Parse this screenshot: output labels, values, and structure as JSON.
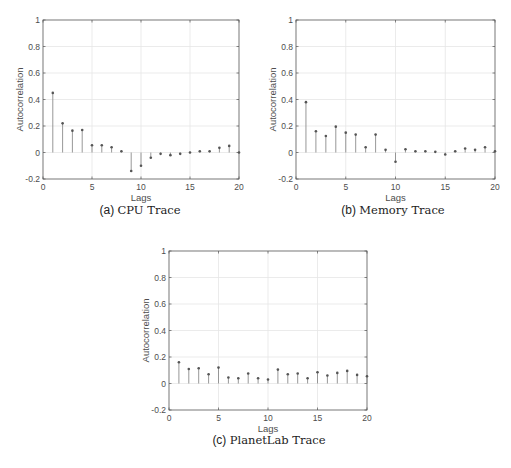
{
  "chart_data": [
    {
      "id": "cpu",
      "type": "stem",
      "title": "",
      "caption_tag": "(a)",
      "caption_name": "CPU Trace",
      "xlabel": "Lags",
      "ylabel": "Autocorrelation",
      "xlim": [
        0,
        20
      ],
      "ylim": [
        -0.2,
        1
      ],
      "xticks": [
        0,
        5,
        10,
        15,
        20
      ],
      "yticks": [
        -0.2,
        0,
        0.2,
        0.4,
        0.6,
        0.8,
        1
      ],
      "ytick_labels": [
        "-0.2",
        "0",
        "0.2",
        "0.4",
        "0.6",
        "0.8",
        "1"
      ],
      "grid": true,
      "x": [
        1,
        2,
        3,
        4,
        5,
        6,
        7,
        8,
        9,
        10,
        11,
        12,
        13,
        14,
        15,
        16,
        17,
        18,
        19,
        20
      ],
      "values": [
        0.45,
        0.22,
        0.165,
        0.17,
        0.055,
        0.055,
        0.04,
        0.01,
        -0.14,
        -0.1,
        -0.04,
        -0.01,
        -0.02,
        -0.01,
        0.0,
        0.01,
        0.01,
        0.035,
        0.05,
        0.0
      ]
    },
    {
      "id": "memory",
      "type": "stem",
      "title": "",
      "caption_tag": "(b)",
      "caption_name": "Memory Trace",
      "xlabel": "Lags",
      "ylabel": "Autocorrelation",
      "xlim": [
        0,
        20
      ],
      "ylim": [
        -0.2,
        1
      ],
      "xticks": [
        0,
        5,
        10,
        15,
        20
      ],
      "yticks": [
        -0.2,
        0,
        0.2,
        0.4,
        0.6,
        0.8,
        1
      ],
      "ytick_labels": [
        "-0.2",
        "0",
        "0.2",
        "0.4",
        "0.6",
        "0.8",
        "1"
      ],
      "grid": true,
      "x": [
        1,
        2,
        3,
        4,
        5,
        6,
        7,
        8,
        9,
        10,
        11,
        12,
        13,
        14,
        15,
        16,
        17,
        18,
        19,
        20
      ],
      "values": [
        0.38,
        0.16,
        0.125,
        0.195,
        0.15,
        0.135,
        0.04,
        0.135,
        0.02,
        -0.07,
        0.025,
        0.01,
        0.01,
        0.005,
        -0.015,
        0.01,
        0.03,
        0.02,
        0.04,
        0.01
      ]
    },
    {
      "id": "planetlab",
      "type": "stem",
      "title": "",
      "caption_tag": "(c)",
      "caption_name": "PlanetLab Trace",
      "xlabel": "Lags",
      "ylabel": "Autocorrelation",
      "xlim": [
        0,
        20
      ],
      "ylim": [
        -0.2,
        1
      ],
      "xticks": [
        0,
        5,
        10,
        15,
        20
      ],
      "yticks": [
        -0.2,
        0,
        0.2,
        0.4,
        0.6,
        0.8,
        1
      ],
      "ytick_labels": [
        "-0.2",
        "0",
        "0.2",
        "0.4",
        "0.6",
        "0.8",
        "1"
      ],
      "grid": true,
      "x": [
        1,
        2,
        3,
        4,
        5,
        6,
        7,
        8,
        9,
        10,
        11,
        12,
        13,
        14,
        15,
        16,
        17,
        18,
        19,
        20
      ],
      "values": [
        0.16,
        0.11,
        0.115,
        0.07,
        0.12,
        0.045,
        0.04,
        0.075,
        0.04,
        0.03,
        0.105,
        0.07,
        0.075,
        0.04,
        0.085,
        0.06,
        0.08,
        0.095,
        0.065,
        0.055
      ]
    }
  ],
  "colors": {
    "axis": "#555555",
    "grid": "#e6e6e6",
    "stem": "#8c8c8c",
    "marker": "#555555",
    "text": "#4d4d4d"
  }
}
